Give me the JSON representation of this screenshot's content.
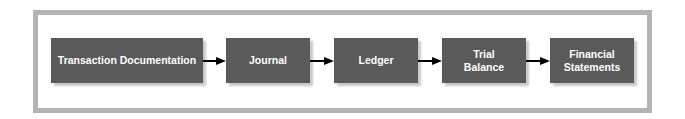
{
  "diagram": {
    "type": "flowchart",
    "direction": "left-to-right",
    "colors": {
      "box_fill": "#5a5a5a",
      "box_text": "#ffffff",
      "frame_border": "#b4b4b4",
      "arrow": "#000000"
    },
    "steps": [
      {
        "label": "Transaction Documentation",
        "lines": [
          "Transaction Documentation"
        ]
      },
      {
        "label": "Journal",
        "lines": [
          "Journal"
        ]
      },
      {
        "label": "Ledger",
        "lines": [
          "Ledger"
        ]
      },
      {
        "label": "Trial Balance",
        "lines": [
          "Trial",
          "Balance"
        ]
      },
      {
        "label": "Financial Statements",
        "lines": [
          "Financial",
          "Statements"
        ]
      }
    ],
    "edges": [
      {
        "from": "Transaction Documentation",
        "to": "Journal"
      },
      {
        "from": "Journal",
        "to": "Ledger"
      },
      {
        "from": "Ledger",
        "to": "Trial Balance"
      },
      {
        "from": "Trial Balance",
        "to": "Financial Statements"
      }
    ]
  }
}
